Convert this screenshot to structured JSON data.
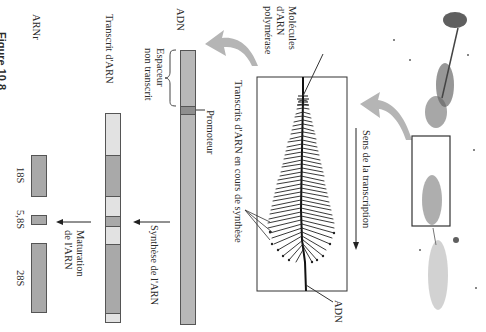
{
  "figure": {
    "label_partial": "Figure 10.8",
    "orientation": "rotated 90° clockwise"
  },
  "labels": {
    "adn_top": "ADN",
    "spacer_line1": "Espaceur",
    "spacer_line2": "non transcrit",
    "promoter": "Promoteur",
    "transcript": "Transcrit d'ARN",
    "synthesis": "Synthèse de l'ARN",
    "rrna": "ARNr",
    "maturation_line1": "Maturation",
    "maturation_line2": "de l'ARN",
    "transcripts_in_progress": "Transcrits d'ARN en cours de synthèse",
    "polymerase_line1": "Molécules",
    "polymerase_line2": "d'ARN",
    "polymerase_line3": "polymérase",
    "adn_bottom": "ADN",
    "direction": "Sens de la transcription"
  },
  "rrna_units": [
    {
      "name": "18S"
    },
    {
      "name": "5,8S"
    },
    {
      "name": "28S"
    }
  ],
  "colors": {
    "dna_bar": "#b8b8b8",
    "promoter": "#8e8e8e",
    "rrna_segment": "#a9a9a9",
    "spacer_segment": "#e2e2e2",
    "curved_arrow": "#b5b5b5",
    "outline": "#555555"
  }
}
